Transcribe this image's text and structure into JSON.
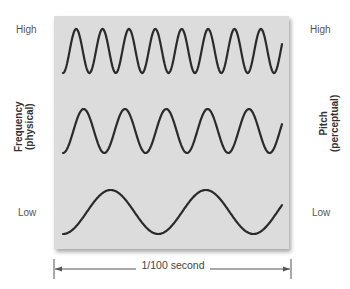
{
  "labels": {
    "left_high": "High",
    "left_low": "Low",
    "right_high": "High",
    "right_low": "Low",
    "left_axis_line1": "Frequency",
    "left_axis_line2": "(physical)",
    "right_axis_line1": "Pitch",
    "right_axis_line2": "(perceptual)",
    "time_span": "1/100 second"
  },
  "colors": {
    "panel": "#dcdcdc",
    "wave": "#2a2a2a",
    "text": "#555555"
  },
  "waves": [
    {
      "name": "high",
      "cycles_visible": 8.3,
      "center_y": 51,
      "amplitude": 22
    },
    {
      "name": "medium",
      "cycles_visible": 5.3,
      "center_y": 131,
      "amplitude": 22
    },
    {
      "name": "low",
      "cycles_visible": 2.3,
      "center_y": 212,
      "amplitude": 22
    }
  ]
}
